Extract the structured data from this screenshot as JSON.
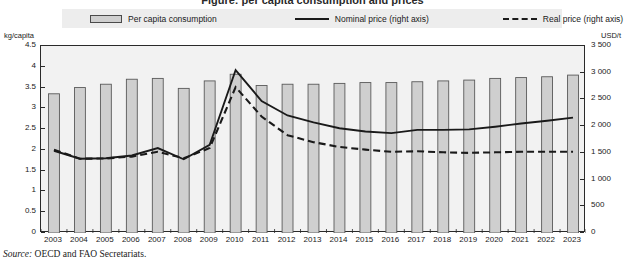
{
  "figure": {
    "title_cropped": "Figure: per capita consumption and prices",
    "source_prefix": "Source:",
    "source_text": "OECD and FAO Secretariats."
  },
  "legend": {
    "items": [
      {
        "label": "Per capita consumption",
        "marker": "filled-bar-swatch",
        "color": "#cfcfcf"
      },
      {
        "label": "Nominal price (right axis)",
        "marker": "solid-line-swatch",
        "color": "#1a1a1a"
      },
      {
        "label": "Real price (right axis)",
        "marker": "dashed-line-swatch",
        "color": "#1a1a1a"
      }
    ],
    "background": "#ededed"
  },
  "axes": {
    "left_unit": "kg/capita",
    "right_unit": "USD/t",
    "left_ticks": [
      "4.5",
      "4",
      "3.5",
      "3",
      "2.5",
      "2",
      "1.5",
      "1",
      "0.5",
      "0"
    ],
    "right_ticks": [
      "3 500",
      "3 000",
      "2 500",
      "2 000",
      "1 500",
      "1 000",
      "500",
      "0"
    ]
  },
  "chart_data": {
    "type": "bar",
    "title": "Per capita consumption and prices",
    "xlabel": "",
    "ylabel": "kg/capita",
    "y2label": "USD/t",
    "ylim": [
      0,
      4.5
    ],
    "y2lim": [
      0,
      3500
    ],
    "grid": false,
    "legend_position": "top",
    "categories": [
      "2003",
      "2004",
      "2005",
      "2006",
      "2007",
      "2008",
      "2009",
      "2010",
      "2011",
      "2012",
      "2013",
      "2014",
      "2015",
      "2016",
      "2017",
      "2018",
      "2019",
      "2020",
      "2021",
      "2022",
      "2023"
    ],
    "series": [
      {
        "name": "Per capita consumption",
        "type": "bar",
        "axis": "left",
        "unit": "kg/capita",
        "color": "#cfcfcf",
        "values": [
          3.35,
          3.5,
          3.58,
          3.7,
          3.72,
          3.48,
          3.66,
          3.82,
          3.55,
          3.58,
          3.58,
          3.6,
          3.62,
          3.62,
          3.64,
          3.66,
          3.68,
          3.72,
          3.74,
          3.76,
          3.8
        ]
      },
      {
        "name": "Nominal price (right axis)",
        "type": "line",
        "axis": "right",
        "unit": "USD/t",
        "style": "solid",
        "color": "#1a1a1a",
        "values": [
          1540,
          1390,
          1400,
          1450,
          1590,
          1380,
          1650,
          3050,
          2470,
          2200,
          2070,
          1960,
          1900,
          1870,
          1930,
          1930,
          1940,
          1990,
          2050,
          2100,
          2160
        ]
      },
      {
        "name": "Real price (right axis)",
        "type": "line",
        "axis": "right",
        "unit": "USD/t",
        "style": "dashed",
        "color": "#1a1a1a",
        "values": [
          1560,
          1390,
          1395,
          1430,
          1520,
          1400,
          1590,
          2730,
          2180,
          1830,
          1700,
          1610,
          1560,
          1520,
          1530,
          1510,
          1500,
          1510,
          1520,
          1520,
          1520
        ]
      }
    ]
  }
}
